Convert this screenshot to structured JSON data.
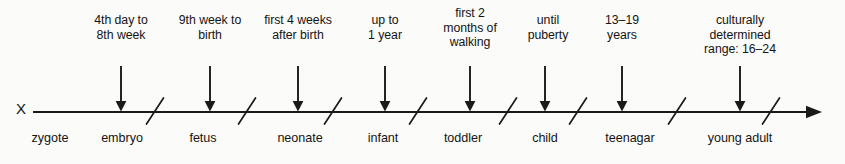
{
  "diagram": {
    "type": "timeline",
    "origin_label": "X",
    "axis": {
      "start_x": 33,
      "end_x": 822,
      "y": 112,
      "has_end_arrowhead": true,
      "color": "#1a1a1a"
    },
    "separators_x": [
      155,
      247,
      333,
      418,
      508,
      578,
      677,
      771
    ],
    "stages": [
      {
        "name": "zygote",
        "name_x": 50,
        "caption": "",
        "caption_x": null,
        "caption_y": null,
        "arrow_x": null
      },
      {
        "name": "embryo",
        "name_x": 122,
        "caption": "4th day to\n8th week",
        "caption_x": 121,
        "caption_y": 13,
        "arrow_x": 121
      },
      {
        "name": "fetus",
        "name_x": 203,
        "caption": "9th week to\nbirth",
        "caption_x": 210,
        "caption_y": 13,
        "arrow_x": 210
      },
      {
        "name": "neonate",
        "name_x": 300,
        "caption": "first 4 weeks\nafter birth",
        "caption_x": 298,
        "caption_y": 13,
        "arrow_x": 298
      },
      {
        "name": "infant",
        "name_x": 383,
        "caption": "up to\n1 year",
        "caption_x": 385,
        "caption_y": 13,
        "arrow_x": 385
      },
      {
        "name": "toddler",
        "name_x": 463,
        "caption": "first 2\nmonths of\nwalking",
        "caption_x": 470,
        "caption_y": 6,
        "arrow_x": 470
      },
      {
        "name": "child",
        "name_x": 545,
        "caption": "until\npuberty",
        "caption_x": 548,
        "caption_y": 13,
        "arrow_x": 545
      },
      {
        "name": "teenagar",
        "name_x": 630,
        "caption": "13–19\nyears",
        "caption_x": 622,
        "caption_y": 13,
        "arrow_x": 622
      },
      {
        "name": "young adult",
        "name_x": 740,
        "caption": "culturally determined\nrange: 16–24",
        "caption_x": 740,
        "caption_y": 13,
        "arrow_x": 740
      }
    ]
  }
}
